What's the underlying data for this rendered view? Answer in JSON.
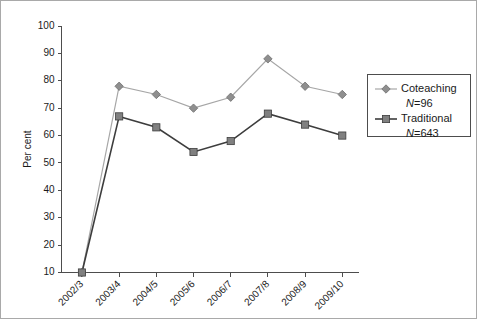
{
  "chart_data": {
    "type": "line",
    "title": "",
    "xlabel": "",
    "ylabel": "Per cent",
    "categories": [
      "2002/3",
      "2003/4",
      "2004/5",
      "2005/6",
      "2006/7",
      "2007/8",
      "2008/9",
      "2009/10"
    ],
    "series": [
      {
        "name": "Coteaching",
        "sub_label": "N=96",
        "marker": "diamond",
        "color": "#a6a6a6",
        "values": [
          10,
          78,
          75,
          70,
          74,
          88,
          78,
          75
        ]
      },
      {
        "name": "Traditional",
        "sub_label": "N=643",
        "marker": "square",
        "color": "#3d3d3d",
        "values": [
          10,
          67,
          63,
          54,
          58,
          68,
          64,
          60
        ]
      }
    ],
    "ylim": [
      10,
      100
    ],
    "ytick_values": [
      10,
      20,
      30,
      40,
      50,
      60,
      70,
      80,
      90,
      100
    ],
    "ytick_labels": [
      "10",
      "20",
      "30",
      "40",
      "50",
      "60",
      "70",
      "80",
      "90",
      "100"
    ],
    "grid": false,
    "legend_position": "right"
  },
  "legend": {
    "entries": [
      {
        "label": "Coteaching",
        "n_text": "N=96"
      },
      {
        "label": "Traditional",
        "n_text": "N=643"
      }
    ]
  }
}
